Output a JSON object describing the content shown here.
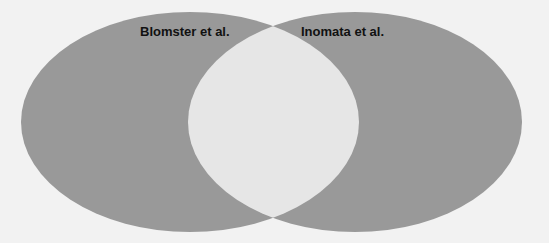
{
  "diagram": {
    "type": "venn",
    "colors": {
      "background": "#f2f2f2",
      "set_fill": "#999999",
      "overlap_fill": "#e6e6e6"
    },
    "sets": [
      {
        "label": "Blomster et al."
      },
      {
        "label": "Inomata et al."
      }
    ]
  }
}
